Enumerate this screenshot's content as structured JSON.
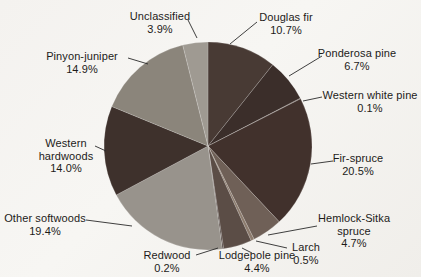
{
  "figure": {
    "background_color": "#f4f2ef",
    "text_color": "#1d1b19",
    "leader_line_color": "#2a2a2a"
  },
  "chart_data": {
    "type": "pie",
    "title": "",
    "legend_position": "none",
    "label_style": "outside-with-leader-lines",
    "start_angle_deg": 0,
    "direction": "clockwise",
    "categories": [
      "Douglas fir",
      "Ponderosa pine",
      "Western white pine",
      "Fir-spruce",
      "Hemlock-Sitka spruce",
      "Larch",
      "Lodgepole pine",
      "Redwood",
      "Other softwoods",
      "Western hardwoods",
      "Pinyon-juniper",
      "Unclassified"
    ],
    "values": [
      10.7,
      6.7,
      0.1,
      20.5,
      4.7,
      0.5,
      4.4,
      0.2,
      19.4,
      14.0,
      14.9,
      3.9
    ],
    "slices": [
      {
        "label": "Douglas fir",
        "value": 10.7,
        "display": "10.7%",
        "color": "#483a34"
      },
      {
        "label": "Ponderosa pine",
        "value": 6.7,
        "display": "6.7%",
        "color": "#3b2e2a"
      },
      {
        "label": "Western white pine",
        "value": 0.1,
        "display": "0.1%",
        "color": "#5f5048"
      },
      {
        "label": "Fir-spruce",
        "value": 20.5,
        "display": "20.5%",
        "color": "#41312c"
      },
      {
        "label": "Hemlock-Sitka spruce",
        "value": 4.7,
        "display": "4.7%",
        "color": "#6f6057"
      },
      {
        "label": "Larch",
        "value": 0.5,
        "display": "0.5%",
        "color": "#8c7b6d"
      },
      {
        "label": "Lodgepole pine",
        "value": 4.4,
        "display": "4.4%",
        "color": "#5b4d46"
      },
      {
        "label": "Redwood",
        "value": 0.2,
        "display": "0.2%",
        "color": "#483c37"
      },
      {
        "label": "Other softwoods",
        "value": 19.4,
        "display": "19.4%",
        "color": "#98938c"
      },
      {
        "label": "Western hardwoods",
        "value": 14.0,
        "display": "14.0%",
        "color": "#3e312c"
      },
      {
        "label": "Pinyon-juniper",
        "value": 14.9,
        "display": "14.9%",
        "color": "#8b857b"
      },
      {
        "label": "Unclassified",
        "value": 3.9,
        "display": "3.9%",
        "color": "#9f9a92"
      }
    ]
  }
}
